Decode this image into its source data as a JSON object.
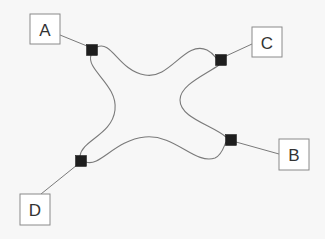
{
  "diagram": {
    "background": "#f7f7f7",
    "line_color": "#7a7a7a",
    "junction_color": "#1e1e1e",
    "nodes": [
      {
        "id": "A",
        "label": "A",
        "x": 30,
        "y": 14,
        "w": 30,
        "h": 30
      },
      {
        "id": "C",
        "label": "C",
        "x": 252,
        "y": 27,
        "w": 30,
        "h": 30
      },
      {
        "id": "B",
        "label": "B",
        "x": 279,
        "y": 139,
        "w": 30,
        "h": 31
      },
      {
        "id": "D",
        "label": "D",
        "x": 20,
        "y": 194,
        "w": 30,
        "h": 31
      }
    ],
    "junctions": [
      {
        "id": "jA",
        "attached_to": "A",
        "cx": 92,
        "cy": 50,
        "size": 11
      },
      {
        "id": "jC",
        "attached_to": "C",
        "cx": 221,
        "cy": 60,
        "size": 11
      },
      {
        "id": "jB",
        "attached_to": "B",
        "cx": 231,
        "cy": 140,
        "size": 11
      },
      {
        "id": "jD",
        "attached_to": "D",
        "cx": 81,
        "cy": 161,
        "size": 11
      }
    ],
    "connectors": [
      {
        "from": "A",
        "to": "jA",
        "x1": 60,
        "y1": 35,
        "x2": 87,
        "y2": 46
      },
      {
        "from": "C",
        "to": "jC",
        "x1": 252,
        "y1": 44,
        "x2": 226,
        "y2": 56
      },
      {
        "from": "B",
        "to": "jB",
        "x1": 279,
        "y1": 154,
        "x2": 236,
        "y2": 142
      },
      {
        "from": "D",
        "to": "jD",
        "x1": 41,
        "y1": 194,
        "x2": 77,
        "y2": 165
      }
    ],
    "curves": [
      {
        "id": "top",
        "from": "jA",
        "to": "jC",
        "d": "M 97 47 C 112 40, 118 70, 145 75 C 170 80, 185 40, 207 50 C 213 53, 215 57, 216 58"
      },
      {
        "id": "left",
        "from": "jA",
        "to": "jD",
        "d": "M 91 55 C 86 70, 118 85, 115 110 C 112 135, 82 140, 80 156"
      },
      {
        "id": "right",
        "from": "jC",
        "to": "jB",
        "d": "M 219 65 C 205 75, 180 85, 180 100 C 180 118, 212 125, 226 137"
      },
      {
        "id": "bottom",
        "from": "jD",
        "to": "jB",
        "d": "M 86 162 C 100 167, 115 140, 145 137 C 175 134, 195 165, 215 158 C 222 155, 224 146, 226 142"
      }
    ]
  }
}
